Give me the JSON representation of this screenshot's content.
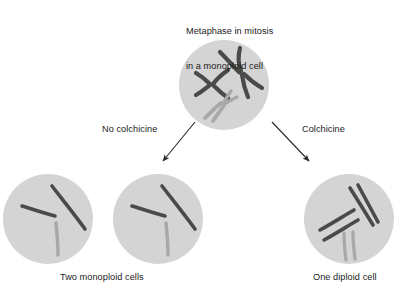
{
  "figure": {
    "title_line1": "Metaphase in mitosis",
    "title_line2": "in a monoploid cell",
    "background_color": "#ffffff",
    "cell_fill_color": "#d4d4d4",
    "chromosome_dark_color": "#4a4a4a",
    "chromosome_light_color": "#a8a8a8",
    "arrow_color": "#2b2b2b"
  },
  "branches": {
    "left_label": "No colchicine",
    "right_label": "Colchicine"
  },
  "captions": {
    "left": "Two monoploid cells",
    "right": "One diploid cell"
  },
  "cells": {
    "parent": {
      "name": "metaphase-monoploid-cell",
      "cx": 224,
      "cy": 85,
      "r": 45,
      "chromosome_count": 3,
      "chromosome_shape": "metaphase-x-shaped-sister-chromatids",
      "chromosomes": [
        {
          "id": "chr1-dark-x",
          "color": "dark",
          "orientation": "horizontal"
        },
        {
          "id": "chr2-dark-x",
          "color": "dark",
          "orientation": "diagonal"
        },
        {
          "id": "chr3-light-x",
          "color": "light",
          "orientation": "diagonal-lower"
        }
      ]
    },
    "daughter_left": {
      "name": "monoploid-daughter-cell-1",
      "cx": 48,
      "cy": 219,
      "r": 45,
      "chromosome_count": 3,
      "chromosome_shape": "single-chromatid-bent",
      "chromosomes": [
        {
          "id": "chr1-dark",
          "color": "dark"
        },
        {
          "id": "chr2-dark",
          "color": "dark"
        },
        {
          "id": "chr3-light",
          "color": "light"
        }
      ]
    },
    "daughter_middle": {
      "name": "monoploid-daughter-cell-2",
      "cx": 158,
      "cy": 219,
      "r": 45,
      "chromosome_count": 3,
      "chromosome_shape": "single-chromatid-bent",
      "chromosomes": [
        {
          "id": "chr1-dark",
          "color": "dark"
        },
        {
          "id": "chr2-dark",
          "color": "dark"
        },
        {
          "id": "chr3-light",
          "color": "light"
        }
      ]
    },
    "diploid": {
      "name": "diploid-cell",
      "cx": 349,
      "cy": 219,
      "r": 45,
      "chromosome_count": 6,
      "chromosome_shape": "single-chromatid-paired",
      "chromosomes": [
        {
          "id": "chr1a-dark",
          "color": "dark"
        },
        {
          "id": "chr1b-dark",
          "color": "dark"
        },
        {
          "id": "chr2a-dark",
          "color": "dark"
        },
        {
          "id": "chr2b-dark",
          "color": "dark"
        },
        {
          "id": "chr3a-light",
          "color": "light"
        },
        {
          "id": "chr3b-light",
          "color": "light"
        }
      ]
    }
  },
  "arrows": [
    {
      "name": "arrow-no-colchicine",
      "from_x": 195,
      "from_y": 122,
      "to_x": 161,
      "to_y": 163
    },
    {
      "name": "arrow-colchicine",
      "from_x": 272,
      "from_y": 122,
      "to_x": 311,
      "to_y": 163
    }
  ]
}
